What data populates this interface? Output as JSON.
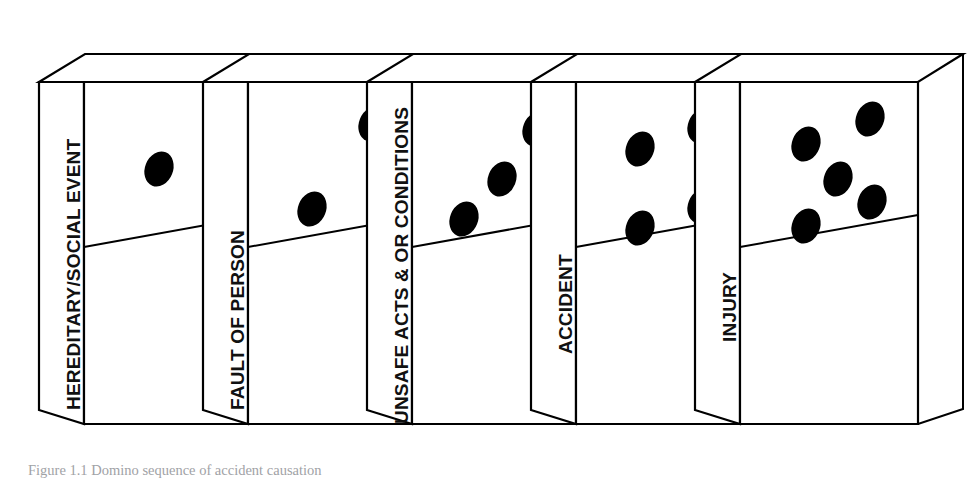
{
  "figure": {
    "type": "domino-sequence-diagram",
    "orientation": "left-to-right",
    "background_color": "#ffffff",
    "line_color": "#000000",
    "pip_color": "#000000",
    "caption": "Figure 1.1  Domino sequence of accident causation"
  },
  "flow": {
    "arrow_label": "arrow-right",
    "arrowhead_at": "far-right",
    "segments": 5
  },
  "dominoes": [
    {
      "index": 1,
      "label": "HEREDITARY/SOCIAL EVENT",
      "pip_count": 1,
      "pips": [
        [
          0.42,
          0.255
        ]
      ]
    },
    {
      "index": 2,
      "label": "FAULT OF PERSON",
      "pip_count": 2,
      "pips": [
        [
          0.7,
          0.135
        ],
        [
          0.38,
          0.375
        ]
      ]
    },
    {
      "index": 3,
      "label": "UNSAFE ACTS & OR CONDITIONS",
      "pip_count": 3,
      "pips": [
        [
          0.7,
          0.145
        ],
        [
          0.5,
          0.285
        ],
        [
          0.31,
          0.415
        ]
      ]
    },
    {
      "index": 4,
      "label": "ACCIDENT",
      "pip_count": 4,
      "pips": [
        [
          0.7,
          0.14
        ],
        [
          0.38,
          0.215
        ],
        [
          0.7,
          0.33
        ],
        [
          0.38,
          0.41
        ]
      ]
    },
    {
      "index": 5,
      "label": "INJURY",
      "pip_count": 5,
      "pips": [
        [
          0.72,
          0.125
        ],
        [
          0.38,
          0.205
        ],
        [
          0.55,
          0.29
        ],
        [
          0.74,
          0.33
        ],
        [
          0.38,
          0.405
        ]
      ]
    }
  ]
}
